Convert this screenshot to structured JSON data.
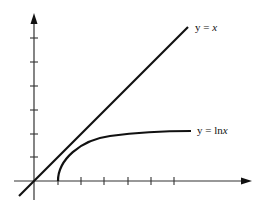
{
  "diagram": {
    "title": "",
    "curves": [
      {
        "name": "line",
        "label_prefix": "y = ",
        "label_var": "x",
        "equation": "y = x"
      },
      {
        "name": "log",
        "label_prefix": "y = ln",
        "label_var": "x",
        "equation": "y = ln x"
      }
    ],
    "x_axis": {
      "ticks": 6
    },
    "y_axis": {
      "ticks": 6
    },
    "colors": {
      "stroke": "#111111",
      "background": "#ffffff"
    }
  }
}
